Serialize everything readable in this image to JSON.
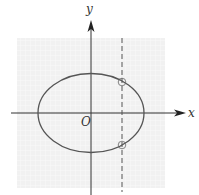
{
  "diagram": {
    "type": "ellipse-with-vertical-line",
    "axes": {
      "x_label": "x",
      "y_label": "y",
      "origin_label": "O"
    },
    "ellipse": {
      "cx": 91,
      "cy": 113,
      "rx": 53,
      "ry": 39.5
    },
    "vertical_line": {
      "x": 122,
      "style": "dashed"
    },
    "intersection_points": [
      {
        "x": 122,
        "y": 82
      },
      {
        "x": 122,
        "y": 145
      }
    ],
    "colors": {
      "grid_background": "#f2f2f2",
      "grid_line": "#ffffff",
      "curve": "#555555",
      "axis": "#333333"
    }
  }
}
